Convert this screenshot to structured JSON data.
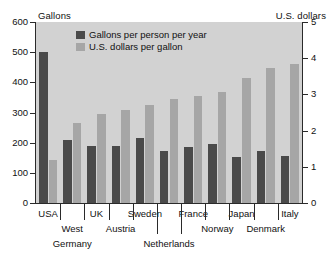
{
  "chart_data": {
    "type": "bar",
    "title": "",
    "subtitle": "",
    "grid": false,
    "legend_position": "top-center",
    "categories": [
      "USA",
      "West Germany",
      "UK",
      "Austria",
      "Sweden",
      "Netherlands",
      "France",
      "Norway",
      "Japan",
      "Denmark",
      "Italy"
    ],
    "series": [
      {
        "name": "Gallons per person per year",
        "axis": "left",
        "color": "#4a4a4a",
        "values": [
          500,
          208,
          188,
          188,
          214,
          172,
          187,
          197,
          154,
          174,
          156
        ]
      },
      {
        "name": "U.S. dollars per gallon",
        "axis": "right",
        "color": "#a6a6a6",
        "values": [
          1.2,
          2.2,
          2.45,
          2.57,
          2.72,
          2.86,
          2.95,
          3.07,
          3.45,
          3.72,
          3.85
        ]
      }
    ],
    "left_axis": {
      "label": "Gallons",
      "ticks": [
        0,
        100,
        200,
        300,
        400,
        500,
        600
      ],
      "ylim": [
        0,
        600
      ]
    },
    "right_axis": {
      "label": "U.S. dollars",
      "ticks": [
        0,
        1,
        2,
        3,
        4,
        5
      ],
      "ylim": [
        0,
        5
      ]
    },
    "xlabel": ""
  },
  "axes": {
    "left_caption": "Gallons",
    "right_caption": "U.S. dollars",
    "left_ticks": [
      "600",
      "500",
      "400",
      "300",
      "200",
      "100",
      "0"
    ],
    "right_ticks": [
      "5",
      "4",
      "3",
      "2",
      "1",
      "0"
    ]
  },
  "legend": {
    "items": [
      {
        "label": "Gallons per person per year",
        "color": "#4a4a4a"
      },
      {
        "label": "U.S. dollars per gallon",
        "color": "#a6a6a6"
      }
    ]
  },
  "categories": [
    {
      "name": "USA",
      "row": 0
    },
    {
      "name": "West",
      "row": 1
    },
    {
      "name": "Germany",
      "row": 2
    },
    {
      "name": "UK",
      "row": 0
    },
    {
      "name": "Austria",
      "row": 1
    },
    {
      "name": "Sweden",
      "row": 0
    },
    {
      "name": "Netherlands",
      "row": 2
    },
    {
      "name": "France",
      "row": 0
    },
    {
      "name": "Norway",
      "row": 1
    },
    {
      "name": "Japan",
      "row": 0
    },
    {
      "name": "Denmark",
      "row": 1
    },
    {
      "name": "Italy",
      "row": 0
    }
  ],
  "colors": {
    "plot_background": "#d2d2d2",
    "dark_bar": "#4a4a4a",
    "light_bar": "#a6a6a6",
    "axis": "#2a2a2a",
    "page_background": "#ffffff"
  }
}
